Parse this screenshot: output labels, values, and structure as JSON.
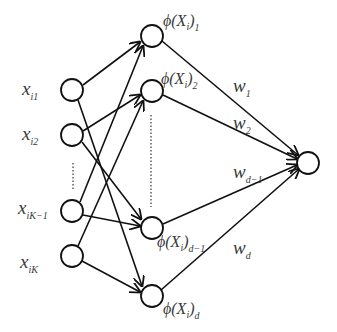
{
  "diagram": {
    "type": "neural-network",
    "input_nodes": [
      {
        "id": "x_i1",
        "symbol": "x",
        "subscript": "i1",
        "cx": 72,
        "cy": 90
      },
      {
        "id": "x_i2",
        "symbol": "x",
        "subscript": "i2",
        "cx": 72,
        "cy": 135
      },
      {
        "id": "x_iK-1",
        "symbol": "x",
        "subscript": "iK−1",
        "cx": 72,
        "cy": 211
      },
      {
        "id": "x_iK",
        "symbol": "x",
        "subscript": "iK",
        "cx": 72,
        "cy": 256
      }
    ],
    "hidden_nodes": [
      {
        "id": "phi_1",
        "label_main": "ϕ(X",
        "label_sub_i": "i",
        "label_close": ")",
        "label_sub": "1",
        "cx": 152,
        "cy": 36
      },
      {
        "id": "phi_2",
        "label_main": "ϕ(X",
        "label_sub_i": "i",
        "label_close": ")",
        "label_sub": "2",
        "cx": 152,
        "cy": 91
      },
      {
        "id": "phi_d-1",
        "label_main": "ϕ(X",
        "label_sub_i": "i",
        "label_close": ")",
        "label_sub": "d−1",
        "cx": 152,
        "cy": 228
      },
      {
        "id": "phi_d",
        "label_main": "ϕ(X",
        "label_sub_i": "i",
        "label_close": ")",
        "label_sub": "d",
        "cx": 152,
        "cy": 296
      }
    ],
    "output_node": {
      "id": "output",
      "cx": 308,
      "cy": 162
    },
    "weights": [
      {
        "symbol": "w",
        "subscript": "1"
      },
      {
        "symbol": "w",
        "subscript": "2"
      },
      {
        "symbol": "w",
        "subscript": "d−1"
      },
      {
        "symbol": "w",
        "subscript": "d"
      }
    ],
    "ellipsis": "⋮"
  }
}
